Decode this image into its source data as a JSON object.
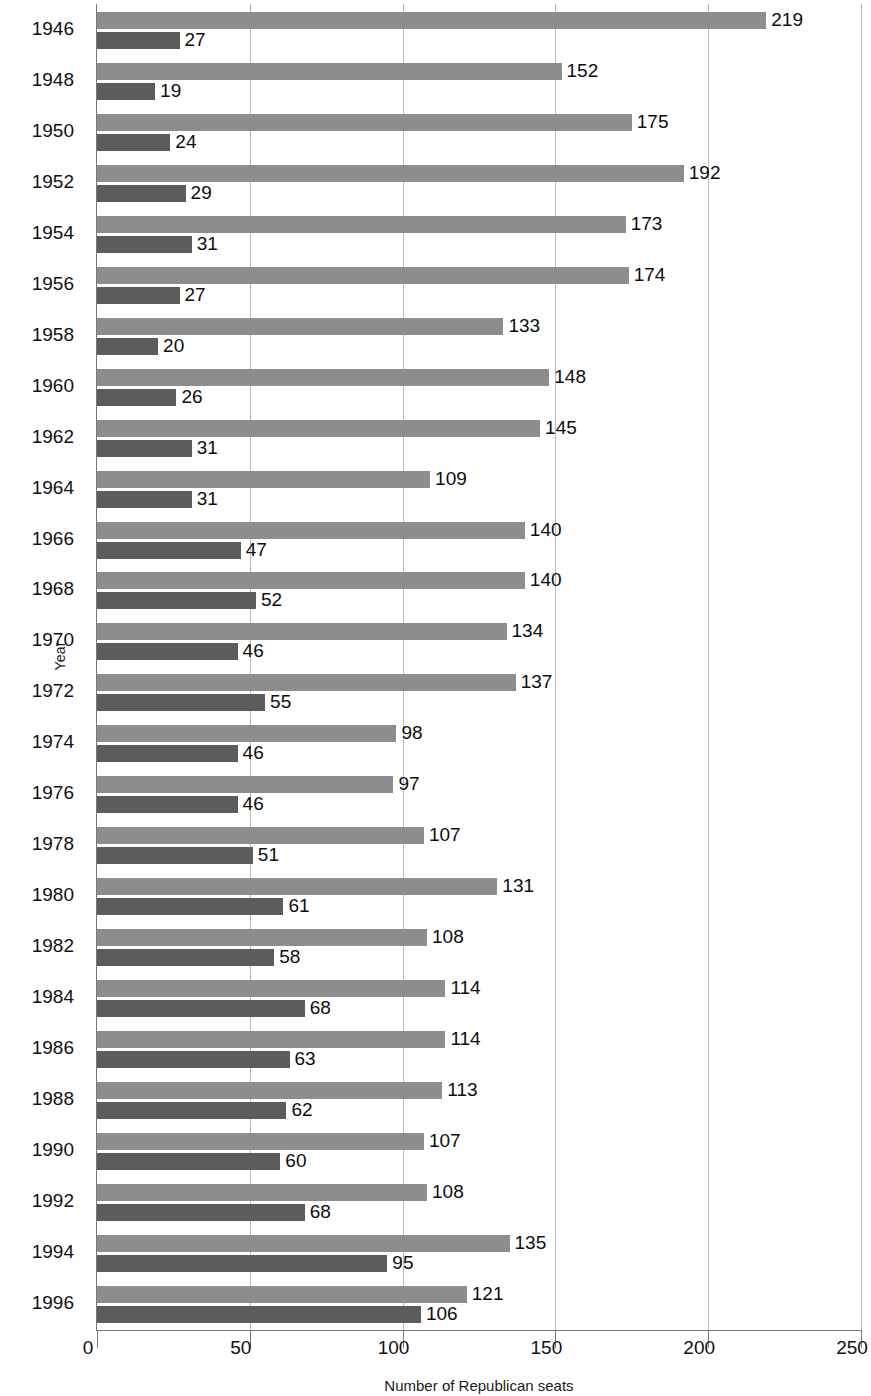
{
  "chart_data": {
    "type": "bar",
    "orientation": "horizontal",
    "title": "",
    "xlabel": "Number of Republican seats",
    "ylabel": "Year",
    "xlim": [
      0,
      250
    ],
    "xticks": [
      0,
      50,
      100,
      150,
      200,
      250
    ],
    "xtick_labels": [
      "0",
      "50",
      "100",
      "150",
      "200",
      "250"
    ],
    "grid": "vertical",
    "legend": "none",
    "categories": [
      "1946",
      "1948",
      "1950",
      "1952",
      "1954",
      "1956",
      "1958",
      "1960",
      "1962",
      "1964",
      "1966",
      "1968",
      "1970",
      "1972",
      "1974",
      "1976",
      "1978",
      "1980",
      "1982",
      "1984",
      "1986",
      "1988",
      "1990",
      "1992",
      "1994",
      "1996"
    ],
    "series": [
      {
        "name": "House",
        "color": "#8d8d8d",
        "values": [
          219,
          152,
          175,
          192,
          173,
          174,
          133,
          148,
          145,
          109,
          140,
          140,
          134,
          137,
          98,
          97,
          107,
          131,
          108,
          114,
          114,
          113,
          107,
          108,
          135,
          121
        ]
      },
      {
        "name": "Senate",
        "color": "#5c5c5c",
        "values": [
          27,
          19,
          24,
          29,
          31,
          27,
          20,
          26,
          31,
          31,
          47,
          52,
          46,
          55,
          46,
          46,
          51,
          61,
          58,
          68,
          63,
          62,
          60,
          68,
          95,
          106
        ]
      }
    ],
    "rows": [
      {
        "year": "1946",
        "a": 219,
        "b": 27
      },
      {
        "year": "1948",
        "a": 152,
        "b": 19
      },
      {
        "year": "1950",
        "a": 175,
        "b": 24
      },
      {
        "year": "1952",
        "a": 192,
        "b": 29
      },
      {
        "year": "1954",
        "a": 173,
        "b": 31
      },
      {
        "year": "1956",
        "a": 174,
        "b": 27
      },
      {
        "year": "1958",
        "a": 133,
        "b": 20
      },
      {
        "year": "1960",
        "a": 148,
        "b": 26
      },
      {
        "year": "1962",
        "a": 145,
        "b": 31
      },
      {
        "year": "1964",
        "a": 109,
        "b": 31
      },
      {
        "year": "1966",
        "a": 140,
        "b": 47
      },
      {
        "year": "1968",
        "a": 140,
        "b": 52
      },
      {
        "year": "1970",
        "a": 134,
        "b": 46
      },
      {
        "year": "1972",
        "a": 137,
        "b": 55
      },
      {
        "year": "1974",
        "a": 98,
        "b": 46
      },
      {
        "year": "1976",
        "a": 97,
        "b": 46
      },
      {
        "year": "1978",
        "a": 107,
        "b": 51
      },
      {
        "year": "1980",
        "a": 131,
        "b": 61
      },
      {
        "year": "1982",
        "a": 108,
        "b": 58
      },
      {
        "year": "1984",
        "a": 114,
        "b": 68
      },
      {
        "year": "1986",
        "a": 114,
        "b": 63
      },
      {
        "year": "1988",
        "a": 113,
        "b": 62
      },
      {
        "year": "1990",
        "a": 107,
        "b": 60
      },
      {
        "year": "1992",
        "a": 108,
        "b": 68
      },
      {
        "year": "1994",
        "a": 135,
        "b": 95
      },
      {
        "year": "1996",
        "a": 121,
        "b": 106
      }
    ],
    "colors": {
      "series_a": "#8d8d8d",
      "series_b": "#5c5c5c",
      "gridline": "#b9b9b9",
      "axis": "#777777",
      "text": "#111111",
      "background": "#ffffff"
    }
  }
}
